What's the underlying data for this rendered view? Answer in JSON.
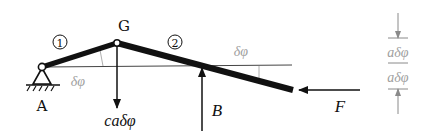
{
  "diagram": {
    "colors": {
      "ink": "#111111",
      "gray": "#9a9a9a",
      "line": "#555555"
    },
    "points": {
      "A": {
        "label": "A"
      },
      "G": {
        "label": "G"
      }
    },
    "bodies": [
      {
        "id": "1",
        "label": "1"
      },
      {
        "id": "2",
        "label": "2"
      }
    ],
    "forces": {
      "gravity_load": {
        "label": "caδφ",
        "direction": "down"
      },
      "support_B": {
        "label": "B",
        "direction": "up"
      },
      "force_F": {
        "label": "F",
        "direction": "left"
      }
    },
    "angles": {
      "left": {
        "label": "δφ"
      },
      "right": {
        "label": "δφ"
      }
    },
    "dimension": {
      "upper": {
        "label": "aδφ"
      },
      "lower": {
        "label": "aδφ"
      }
    }
  }
}
